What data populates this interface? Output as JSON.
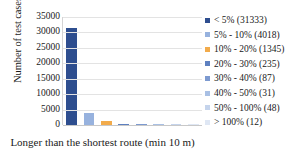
{
  "chart_data": {
    "type": "bar",
    "title": "",
    "xlabel": "Longer than the shortest route (min 10 m)",
    "ylabel": "Number of test cases",
    "categories": [
      "< 5%",
      "5% - 10%",
      "10% - 20%",
      "20% - 30%",
      "30% - 40%",
      "40% - 50%",
      "50% - 100%",
      "> 100%"
    ],
    "values": [
      31333,
      4018,
      1345,
      235,
      87,
      31,
      48,
      12
    ],
    "ylim": [
      0,
      35000
    ],
    "yticks": [
      35000,
      30000,
      25000,
      20000,
      15000,
      10000,
      5000,
      0
    ],
    "ytick_labels": [
      "35000",
      "30000",
      "25000",
      "20000",
      "15000",
      "10000",
      "5000",
      "0"
    ],
    "grid": true,
    "legend_position": "right",
    "colors": [
      "#2e4e8f",
      "#97b2de",
      "#f2ab4b",
      "#5e80c0",
      "#7d9ad0",
      "#a9c0e4",
      "#c5d4ec",
      "#dfe7f4"
    ],
    "legend": [
      {
        "label": "< 5% (31333)",
        "category": "< 5%",
        "value": 31333,
        "color": "#2e4e8f"
      },
      {
        "label": "5% - 10% (4018)",
        "category": "5% - 10%",
        "value": 4018,
        "color": "#97b2de"
      },
      {
        "label": "10% - 20% (1345)",
        "category": "10% - 20%",
        "value": 1345,
        "color": "#f2ab4b"
      },
      {
        "label": "20% - 30% (235)",
        "category": "20% - 30%",
        "value": 235,
        "color": "#5e80c0"
      },
      {
        "label": "30% - 40% (87)",
        "category": "30% - 40%",
        "value": 87,
        "color": "#7d9ad0"
      },
      {
        "label": "40% - 50% (31)",
        "category": "40% - 50%",
        "value": 31,
        "color": "#a9c0e4"
      },
      {
        "label": "50% - 100% (48)",
        "category": "50% - 100%",
        "value": 48,
        "color": "#c5d4ec"
      },
      {
        "label": "> 100% (12)",
        "category": "> 100%",
        "value": 12,
        "color": "#dfe7f4"
      }
    ]
  }
}
